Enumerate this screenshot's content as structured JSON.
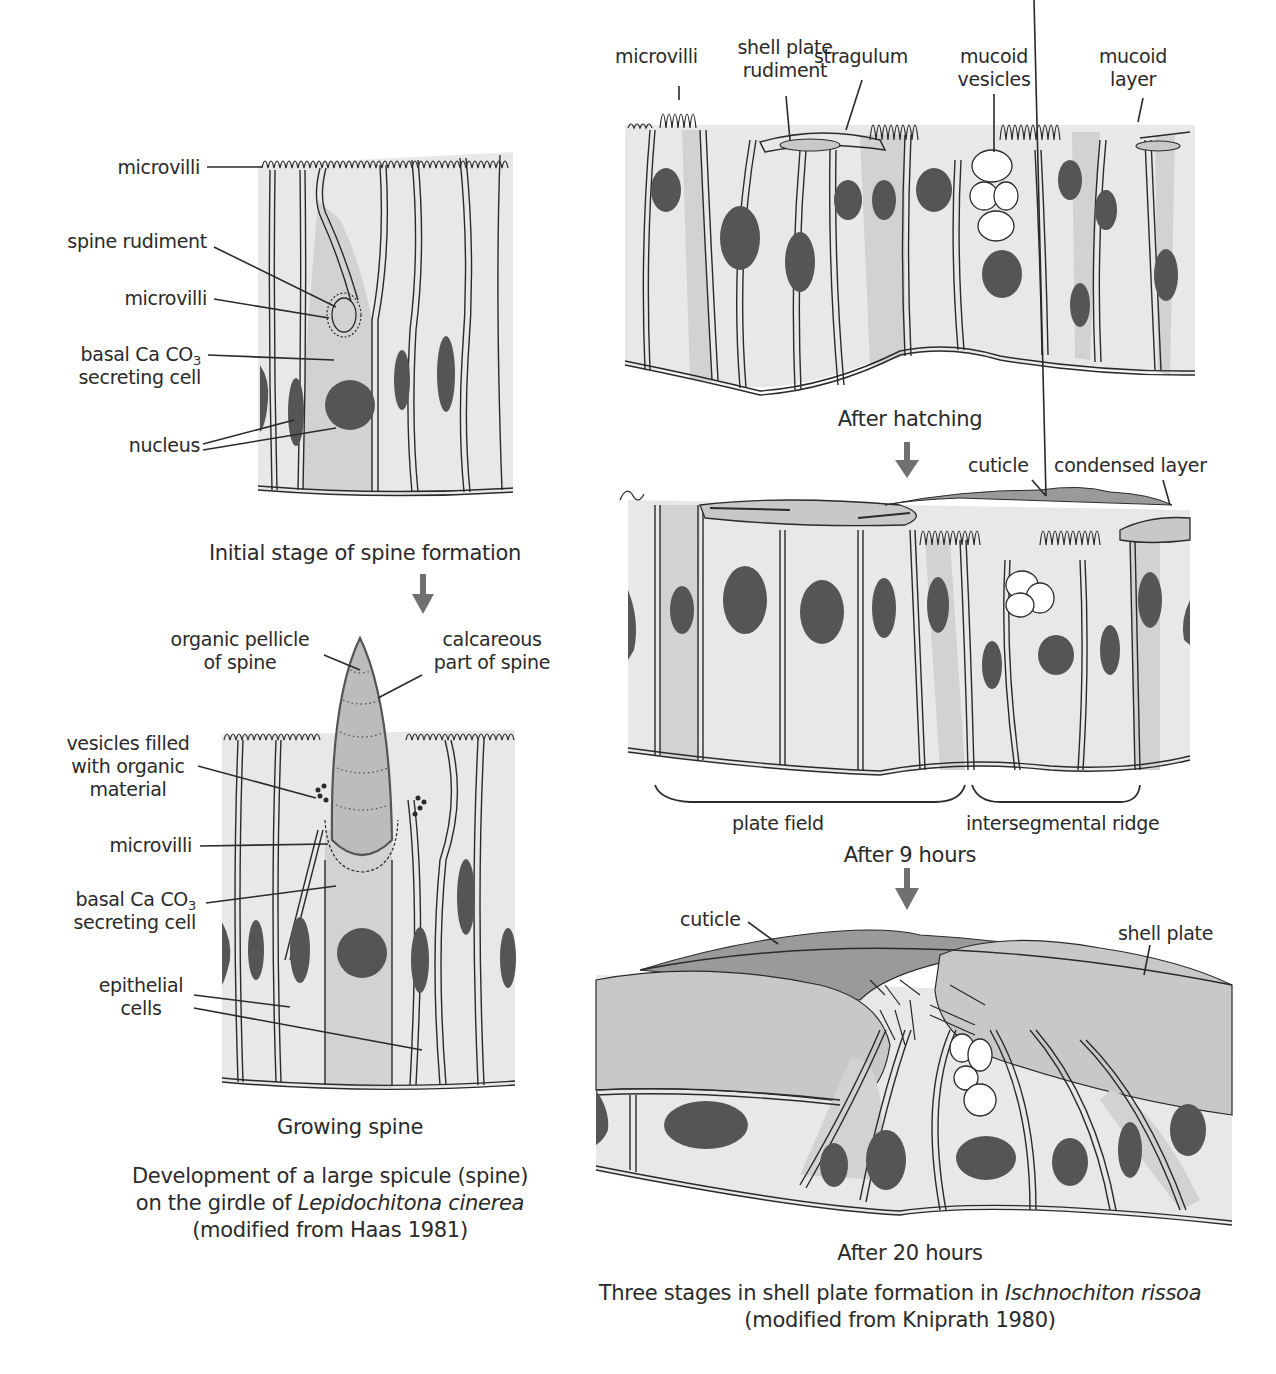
{
  "colors": {
    "background": "#ffffff",
    "cell_fill": "#e8e8e8",
    "secreting_cell_fill": "#d2d2d2",
    "nucleus": "#555555",
    "shell_plate": "#c8c8c8",
    "cuticle": "#9a9a9a",
    "arrow": "#707070",
    "line": "#2a2a2a"
  },
  "left_panel": {
    "stage1": {
      "labels": {
        "microvilli_top": "microvilli",
        "spine_rudiment": "spine rudiment",
        "microvilli": "microvilli",
        "basal_line1": "basal Ca CO",
        "basal_sub": "3",
        "basal_line2": "secreting cell",
        "nucleus": "nucleus"
      },
      "title": "Initial stage of spine formation"
    },
    "stage2": {
      "labels": {
        "organic_pellicle_line1": "organic pellicle",
        "organic_pellicle_line2": "of spine",
        "calcareous_line1": "calcareous",
        "calcareous_line2": "part of spine",
        "vesicles_line1": "vesicles filled",
        "vesicles_line2": "with organic",
        "vesicles_line3": "material",
        "microvilli": "microvilli",
        "basal_line1": "basal Ca CO",
        "basal_sub": "3",
        "basal_line2": "secreting cell",
        "epithelial_line1": "epithelial",
        "epithelial_line2": "cells"
      },
      "title": "Growing spine"
    },
    "caption": {
      "line1": "Development of a large spicule (spine)",
      "line2_prefix": "on the girdle of ",
      "line2_italic": "Lepidochitona cinerea",
      "line3": "(modified from Haas 1981)"
    }
  },
  "right_panel": {
    "stage1": {
      "labels": {
        "microvilli": "microvilli",
        "shell_plate_rudiment_line1": "shell plate",
        "shell_plate_rudiment_line2": "rudiment",
        "stragulum": "stragulum",
        "mucoid_vesicles_line1": "mucoid",
        "mucoid_vesicles_line2": "vesicles",
        "mucoid_layer_line1": "mucoid",
        "mucoid_layer_line2": "layer"
      },
      "title": "After hatching"
    },
    "stage2": {
      "labels": {
        "cuticle": "cuticle",
        "condensed_layer": "condensed layer",
        "plate_field": "plate field",
        "intersegmental_ridge": "intersegmental ridge"
      },
      "title": "After 9 hours"
    },
    "stage3": {
      "labels": {
        "cuticle": "cuticle",
        "shell_plate": "shell plate"
      },
      "title": "After 20 hours"
    },
    "caption": {
      "line1_prefix": "Three stages in shell plate formation in ",
      "line1_italic": "Ischnochiton rissoa",
      "line2": "(modified from Kniprath 1980)"
    }
  }
}
